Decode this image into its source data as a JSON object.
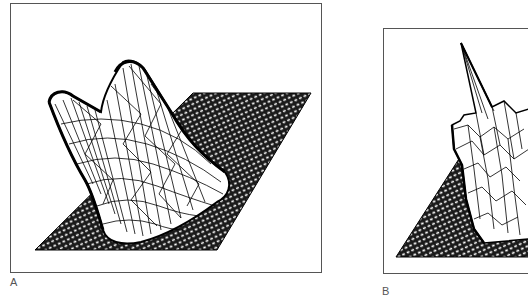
{
  "figure": {
    "type": "two-panel 3D wireframe surface plot",
    "panels": [
      {
        "id": "A",
        "label": "A",
        "description": "Smooth triangulated mesh surface with a tall ridge rising from a flat hatched base plane; two rounded peaks at the top"
      },
      {
        "id": "B",
        "label": "B",
        "description": "Jagged triangulated mesh surface with a sharp spike rising from a flat hatched base plane (cropped at right edge)"
      }
    ],
    "colors": {
      "line": "#000000",
      "border": "#555555",
      "label": "#555555",
      "background": "#ffffff"
    }
  }
}
